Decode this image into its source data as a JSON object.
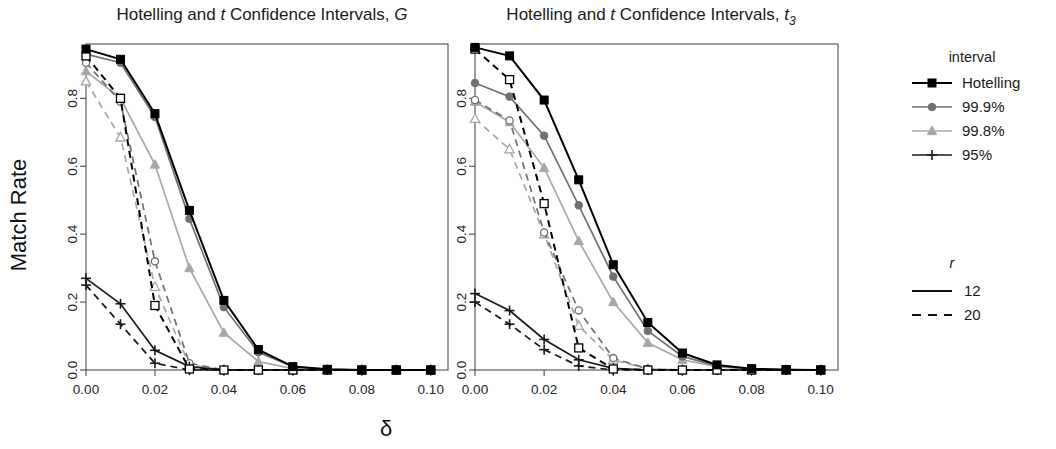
{
  "figure": {
    "y_axis_label": "Match Rate",
    "x_axis_label": "δ"
  },
  "panels": [
    {
      "id": "panel-G",
      "title_main": "Hotelling and ",
      "title_ital1": "t",
      "title_mid": " Confidence Intervals, ",
      "title_ital2": "G",
      "title_full": "Hotelling and t Confidence Intervals, G"
    },
    {
      "id": "panel-t3",
      "title_main": "Hotelling and ",
      "title_ital1": "t",
      "title_mid": " Confidence Intervals, ",
      "title_ital2": "t",
      "title_sub": "3",
      "title_full": "Hotelling and t Confidence Intervals, t3"
    }
  ],
  "legend_interval": {
    "title": "interval",
    "items": [
      {
        "label": "Hotelling",
        "color": "#000000",
        "marker": "square"
      },
      {
        "label": "99.9%",
        "color": "#707070",
        "marker": "circle"
      },
      {
        "label": "99.8%",
        "color": "#a8a8a8",
        "marker": "triangle"
      },
      {
        "label": "95%",
        "color": "#1a1a1a",
        "marker": "plus"
      }
    ]
  },
  "legend_r": {
    "title": "r",
    "items": [
      {
        "label": "12",
        "dash": "solid"
      },
      {
        "label": "20",
        "dash": "dashed"
      }
    ]
  },
  "axis": {
    "x_ticks": [
      "0.00",
      "0.02",
      "0.04",
      "0.06",
      "0.08",
      "0.10"
    ],
    "y_ticks": [
      "0.0",
      "0.2",
      "0.4",
      "0.6",
      "0.8"
    ]
  },
  "chart_data": {
    "type": "line",
    "title": "Hotelling and t Confidence Intervals",
    "xlabel": "δ",
    "ylabel": "Match Rate",
    "xlim": [
      0.0,
      0.105
    ],
    "ylim": [
      0.0,
      0.96
    ],
    "grid": false,
    "legend_position": "right",
    "x": [
      0.0,
      0.01,
      0.02,
      0.03,
      0.04,
      0.05,
      0.06,
      0.07,
      0.08,
      0.09,
      0.1
    ],
    "panels": [
      {
        "name": "G",
        "title": "Hotelling and t Confidence Intervals, G",
        "series": [
          {
            "name": "Hotelling",
            "r": 12,
            "dash": "solid",
            "color": "#000000",
            "marker": "square",
            "values": [
              0.945,
              0.915,
              0.755,
              0.47,
              0.205,
              0.06,
              0.01,
              0.002,
              0.0,
              0.0,
              0.0
            ]
          },
          {
            "name": "Hotelling",
            "r": 20,
            "dash": "dashed",
            "color": "#000000",
            "marker": "square-open",
            "values": [
              0.925,
              0.8,
              0.19,
              0.003,
              0.0,
              0.0,
              0.0,
              0.0,
              0.0,
              0.0,
              0.0
            ]
          },
          {
            "name": "99.9%",
            "r": 12,
            "dash": "solid",
            "color": "#707070",
            "marker": "circle",
            "values": [
              0.93,
              0.905,
              0.745,
              0.445,
              0.185,
              0.052,
              0.01,
              0.002,
              0.0,
              0.0,
              0.0
            ]
          },
          {
            "name": "99.9%",
            "r": 20,
            "dash": "dashed",
            "color": "#707070",
            "marker": "circle-open",
            "values": [
              0.905,
              0.79,
              0.32,
              0.02,
              0.0,
              0.0,
              0.0,
              0.0,
              0.0,
              0.0,
              0.0
            ]
          },
          {
            "name": "99.8%",
            "r": 12,
            "dash": "solid",
            "color": "#a8a8a8",
            "marker": "triangle",
            "values": [
              0.88,
              0.8,
              0.605,
              0.3,
              0.11,
              0.025,
              0.004,
              0.0,
              0.0,
              0.0,
              0.0
            ]
          },
          {
            "name": "99.8%",
            "r": 20,
            "dash": "dashed",
            "color": "#a8a8a8",
            "marker": "triangle-open",
            "values": [
              0.85,
              0.685,
              0.245,
              0.015,
              0.0,
              0.0,
              0.0,
              0.0,
              0.0,
              0.0,
              0.0
            ]
          },
          {
            "name": "95%",
            "r": 12,
            "dash": "solid",
            "color": "#1a1a1a",
            "marker": "plus",
            "values": [
              0.27,
              0.195,
              0.058,
              0.01,
              0.0,
              0.0,
              0.0,
              0.0,
              0.0,
              0.0,
              0.0
            ]
          },
          {
            "name": "95%",
            "r": 20,
            "dash": "dashed",
            "color": "#1a1a1a",
            "marker": "plus",
            "values": [
              0.25,
              0.135,
              0.02,
              0.0,
              0.0,
              0.0,
              0.0,
              0.0,
              0.0,
              0.0,
              0.0
            ]
          }
        ]
      },
      {
        "name": "t3",
        "title": "Hotelling and t Confidence Intervals, t3",
        "series": [
          {
            "name": "Hotelling",
            "r": 12,
            "dash": "solid",
            "color": "#000000",
            "marker": "square",
            "values": [
              0.95,
              0.925,
              0.795,
              0.56,
              0.31,
              0.14,
              0.05,
              0.015,
              0.004,
              0.001,
              0.0
            ]
          },
          {
            "name": "Hotelling",
            "r": 20,
            "dash": "dashed",
            "color": "#000000",
            "marker": "square-open",
            "values": [
              0.945,
              0.855,
              0.49,
              0.065,
              0.003,
              0.0,
              0.0,
              0.0,
              0.0,
              0.0,
              0.0
            ]
          },
          {
            "name": "99.9%",
            "r": 12,
            "dash": "solid",
            "color": "#707070",
            "marker": "circle",
            "values": [
              0.845,
              0.805,
              0.69,
              0.485,
              0.275,
              0.115,
              0.04,
              0.012,
              0.003,
              0.001,
              0.0
            ]
          },
          {
            "name": "99.9%",
            "r": 20,
            "dash": "dashed",
            "color": "#707070",
            "marker": "circle-open",
            "values": [
              0.795,
              0.735,
              0.405,
              0.175,
              0.035,
              0.003,
              0.0,
              0.0,
              0.0,
              0.0,
              0.0
            ]
          },
          {
            "name": "99.8%",
            "r": 12,
            "dash": "solid",
            "color": "#a8a8a8",
            "marker": "triangle",
            "values": [
              0.79,
              0.73,
              0.595,
              0.38,
              0.2,
              0.08,
              0.03,
              0.01,
              0.002,
              0.0,
              0.0
            ]
          },
          {
            "name": "99.8%",
            "r": 20,
            "dash": "dashed",
            "color": "#a8a8a8",
            "marker": "triangle-open",
            "values": [
              0.74,
              0.65,
              0.4,
              0.13,
              0.03,
              0.003,
              0.0,
              0.0,
              0.0,
              0.0,
              0.0
            ]
          },
          {
            "name": "95%",
            "r": 12,
            "dash": "solid",
            "color": "#1a1a1a",
            "marker": "plus",
            "values": [
              0.225,
              0.175,
              0.09,
              0.03,
              0.005,
              0.0,
              0.0,
              0.0,
              0.0,
              0.0,
              0.0
            ]
          },
          {
            "name": "95%",
            "r": 20,
            "dash": "dashed",
            "color": "#1a1a1a",
            "marker": "plus",
            "values": [
              0.2,
              0.135,
              0.06,
              0.012,
              0.0,
              0.0,
              0.0,
              0.0,
              0.0,
              0.0,
              0.0
            ]
          }
        ]
      }
    ]
  }
}
